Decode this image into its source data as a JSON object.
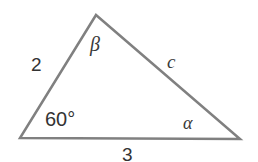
{
  "figure": {
    "type": "triangle-diagram",
    "background_color": "#ffffff",
    "stroke_color": "#808080",
    "stroke_width": 2.5,
    "text_color": "#333333",
    "width": 258,
    "height": 162
  },
  "vertices": {
    "apex": {
      "name": "apex-vertex",
      "x": 96,
      "y": 15
    },
    "bottom_left": {
      "name": "bottom-left-vertex",
      "x": 20,
      "y": 138
    },
    "bottom_right": {
      "name": "bottom-right-vertex",
      "x": 240,
      "y": 139
    }
  },
  "polygon_points": "96,15 240,139 20,138",
  "labels": {
    "side_left": "2",
    "side_bottom": "3",
    "side_right": "c",
    "angle_apex": "β",
    "angle_bottom_left": "60°",
    "angle_bottom_right": "α"
  },
  "chart_data": {
    "type": "diagram",
    "shape": "triangle",
    "title": "",
    "sides": [
      {
        "label": "2",
        "value": 2,
        "position": "left",
        "from": "bottom_left",
        "to": "apex"
      },
      {
        "label": "3",
        "value": 3,
        "position": "bottom",
        "from": "bottom_left",
        "to": "bottom_right"
      },
      {
        "label": "c",
        "value": null,
        "position": "right",
        "from": "apex",
        "to": "bottom_right"
      }
    ],
    "angles": [
      {
        "label": "60°",
        "value": 60,
        "at": "bottom_left"
      },
      {
        "label": "β",
        "value": null,
        "at": "apex"
      },
      {
        "label": "α",
        "value": null,
        "at": "bottom_right"
      }
    ]
  }
}
